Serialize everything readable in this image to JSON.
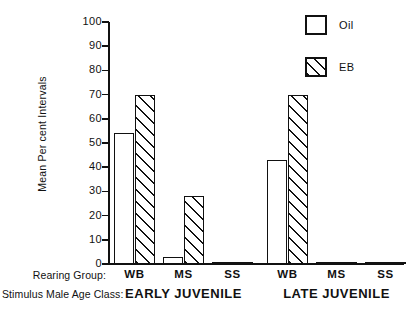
{
  "chart_data": {
    "type": "bar",
    "title": "",
    "xlabel": "Rearing Group",
    "ylabel": "Mean Per cent Intervals",
    "ylim": [
      0,
      100
    ],
    "yticks": [
      0,
      10,
      20,
      30,
      40,
      50,
      60,
      70,
      80,
      90,
      100
    ],
    "grid": false,
    "legend_position": "top-right",
    "categories": [
      "WB",
      "MS",
      "SS",
      "WB",
      "MS",
      "SS"
    ],
    "group_labels": [
      "EARLY JUVENILE",
      "LATE JUVENILE"
    ],
    "group_spans": [
      3,
      3
    ],
    "series": [
      {
        "name": "Oil",
        "fill": "open",
        "values": [
          54,
          3,
          0,
          43,
          0,
          0
        ]
      },
      {
        "name": "EB",
        "fill": "hatched",
        "values": [
          70,
          28,
          0,
          70,
          0,
          0
        ]
      }
    ],
    "axis_titles": {
      "rearing_group": "Rearing Group:",
      "stimulus_male_age_class": "Stimulus Male Age Class:"
    }
  },
  "legend": {
    "items": [
      {
        "label": "Oil",
        "swatch": "open-square-swatch"
      },
      {
        "label": "EB",
        "swatch": "hatched-square-swatch"
      }
    ]
  },
  "colors": {
    "ink": "#111111",
    "background": "#ffffff"
  }
}
